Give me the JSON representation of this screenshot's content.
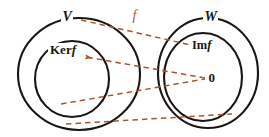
{
  "figure": {
    "colors": {
      "curve": "#1a1512",
      "map_arrow": "#a6572f",
      "text": "#1a1512",
      "background": "#ffffff"
    },
    "labels": {
      "domain_set": "V",
      "codomain_set": "W",
      "kernel_prefix": "Ker",
      "kernel_suffix": "f",
      "image_prefix": "Im",
      "image_suffix": "f",
      "zero_vector": "0",
      "map_name": "f"
    },
    "shapes": [
      {
        "name": "outer-ellipse-V",
        "cx": 79,
        "cy": 74,
        "rx": 61,
        "ry": 56
      },
      {
        "name": "inner-circle-kerf",
        "cx": 72,
        "cy": 79,
        "rx": 37,
        "ry": 38
      },
      {
        "name": "outer-ellipse-W",
        "cx": 208,
        "cy": 73,
        "rx": 50,
        "ry": 55
      },
      {
        "name": "inner-ellipse-imf",
        "cx": 203,
        "cy": 77,
        "rx": 39,
        "ry": 44
      }
    ],
    "arrows": [
      {
        "name": "arrow-V-to-Imf",
        "from": [
          81,
          20
        ],
        "to": [
          196,
          46
        ],
        "arrowhead": "end"
      },
      {
        "name": "arrow-zero-to-Kerf",
        "from": [
          205,
          78
        ],
        "to": [
          84,
          57
        ],
        "arrowhead": "end"
      },
      {
        "name": "arrow-lower-kerf-to-zero",
        "from": [
          61,
          104
        ],
        "to": [
          205,
          79
        ],
        "arrowhead": "none"
      },
      {
        "name": "arrow-bottom-V-to-W",
        "from": [
          66,
          124
        ],
        "to": [
          232,
          114
        ],
        "arrowhead": "none"
      }
    ]
  }
}
